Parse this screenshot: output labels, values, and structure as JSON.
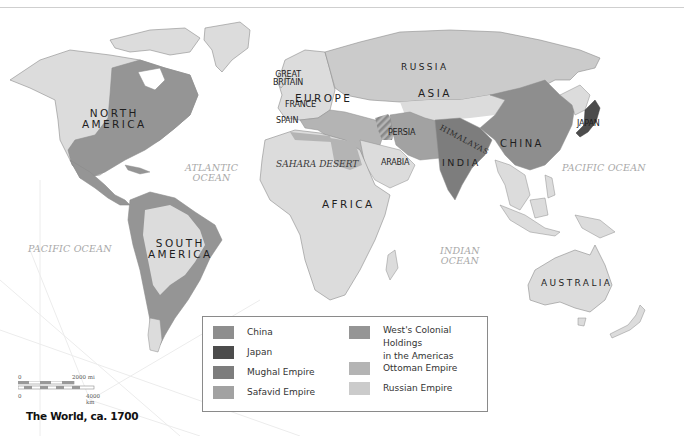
{
  "map": {
    "title": "The World, ca. 1700",
    "colors": {
      "ocean": "#ffffff",
      "land_default": "#dcdcdc",
      "coast": "#8c8c8c",
      "china": "#8e8e8e",
      "japan": "#4c4c4c",
      "mughal": "#7d7d7d",
      "safavid": "#a2a2a2",
      "colonial_americas": "#959595",
      "ottoman": "#b4b4b4",
      "russian": "#cbcbcb"
    },
    "regions": {
      "north_america": [
        "NORTH",
        "AMERICA"
      ],
      "south_america": [
        "SOUTH",
        "AMERICA"
      ],
      "europe": "EUROPE",
      "africa": "AFRICA",
      "asia": "ASIA",
      "russia": "RUSSIA",
      "australia": "AUSTRALIA",
      "china": "CHINA",
      "india": "INDIA"
    },
    "places": {
      "great_britain": [
        "GREAT",
        "BRITAIN"
      ],
      "france": "FRANCE",
      "spain": "SPAIN",
      "persia": "PERSIA",
      "arabia": "ARABIA",
      "japan": "JAPAN"
    },
    "features": {
      "himalayas": "HIMALAYAS",
      "sahara": "SAHARA DESERT"
    },
    "oceans": {
      "atlantic": [
        "ATLANTIC",
        "OCEAN"
      ],
      "pacific_east": "PACIFIC OCEAN",
      "pacific_west": "PACIFIC OCEAN",
      "indian": [
        "INDIAN",
        "OCEAN"
      ]
    },
    "scale_bar": {
      "top_start": "0",
      "top_end": "2000 mi",
      "bottom_start": "0",
      "bottom_end": "4000 km"
    }
  },
  "legend": {
    "items": [
      {
        "label": "China",
        "color": "#8e8e8e"
      },
      {
        "label": "Japan",
        "color": "#4c4c4c"
      },
      {
        "label": "Mughal Empire",
        "color": "#7d7d7d"
      },
      {
        "label": "Safavid Empire",
        "color": "#a2a2a2"
      },
      {
        "label": "West's Colonial Holdings",
        "label2": "in the Americas",
        "color": "#959595"
      },
      {
        "label": "Ottoman Empire",
        "color": "#b4b4b4"
      },
      {
        "label": "Russian Empire",
        "color": "#cbcbcb"
      }
    ]
  }
}
